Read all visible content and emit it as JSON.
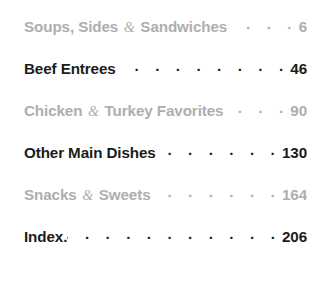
{
  "page": {
    "type": "table-of-contents",
    "background_color": "#ffffff",
    "light_text_color": "#aeaeae",
    "dark_text_color": "#1b1b1b"
  },
  "entries": [
    {
      "title_before_amp": "Soups, Sides ",
      "ampersand": "&",
      "title_after_amp": " Sandwiches",
      "full_title": "Soups, Sides & Sandwiches",
      "leader_dots": ". . . . . . .",
      "page": "6",
      "tone": "light",
      "has_amp": true,
      "attached_period": false
    },
    {
      "title_before_amp": "Beef Entrees",
      "ampersand": "",
      "title_after_amp": "",
      "full_title": "Beef Entrees",
      "leader_dots": ". . . . . . . . . . . . . . . . .",
      "page": "46",
      "tone": "dark",
      "has_amp": false,
      "attached_period": false
    },
    {
      "title_before_amp": "Chicken ",
      "ampersand": "&",
      "title_after_amp": " Turkey Favorites",
      "full_title": "Chicken & Turkey Favorites",
      "leader_dots": ". . . . . .",
      "page": "90",
      "tone": "light",
      "has_amp": true,
      "attached_period": false
    },
    {
      "title_before_amp": "Other Main Dishes",
      "ampersand": "",
      "title_after_amp": "",
      "full_title": "Other Main Dishes",
      "leader_dots": ". . . . . . . . . . . .",
      "page": "130",
      "tone": "dark",
      "has_amp": false,
      "attached_period": false
    },
    {
      "title_before_amp": "Snacks ",
      "ampersand": "&",
      "title_after_amp": " Sweets",
      "full_title": "Snacks & Sweets",
      "leader_dots": ". . . . . . . . . . . . .",
      "page": "164",
      "tone": "light",
      "has_amp": true,
      "attached_period": false
    },
    {
      "title_before_amp": "Index.",
      "ampersand": "",
      "title_after_amp": "",
      "full_title": "Index.",
      "leader_dots": ". . . . . . . . . . . . . . . . . .",
      "page": "206",
      "tone": "dark",
      "has_amp": false,
      "attached_period": true
    }
  ]
}
